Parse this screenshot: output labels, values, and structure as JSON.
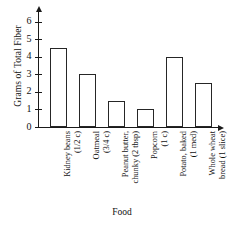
{
  "chart_data": {
    "type": "bar",
    "title": "",
    "xlabel": "Food",
    "ylabel": "Grams of Total Fiber",
    "categories": [
      "Kidney beans (1/2 c)",
      "Oatmeal (3/4 c)",
      "Peanut butter, chunky (2 tbsp)",
      "Popcorn (1 c)",
      "Potato, baked (1 med)",
      "Whole wheat bread (1 slice)"
    ],
    "category_lines": [
      [
        "Kidney beans",
        "(1/2 c)"
      ],
      [
        "Oatmeal",
        "(3/4 c)"
      ],
      [
        "Peanut butter,",
        "chunky (2 tbsp)"
      ],
      [
        "Popcorn",
        "(1 c)"
      ],
      [
        "Potato, baked",
        "(1 med)"
      ],
      [
        "Whole wheat",
        "bread (1 slice)"
      ]
    ],
    "values": [
      4.5,
      3.0,
      1.5,
      1.0,
      4.0,
      2.5
    ],
    "ylim": [
      0,
      6.5
    ],
    "yticks": [
      0,
      1,
      2,
      3,
      4,
      5,
      6
    ],
    "ytick_labels": [
      "0",
      "1",
      "2",
      "3",
      "4",
      "5",
      "6"
    ],
    "grid": false,
    "legend": false,
    "bar_facecolor": "#ffffff",
    "bar_edgecolor": "#262626",
    "axis_color": "#1a1a1a"
  }
}
